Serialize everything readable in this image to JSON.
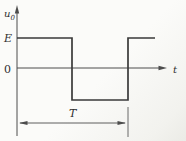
{
  "figure": {
    "background_color": "#fbfbf9",
    "waveform_color": "#3a3a3a",
    "axis_color": "#4c4c4c",
    "labels": {
      "y_axis_base": "u",
      "y_axis_sub": "0",
      "level_high": "E",
      "origin": "0",
      "x_axis": "t",
      "period": "T"
    },
    "waveform": {
      "type": "square",
      "high_level_label": "E",
      "period_label": "T",
      "points": "17,38 72,38 72,100 128,100 128,38 155,38"
    }
  }
}
